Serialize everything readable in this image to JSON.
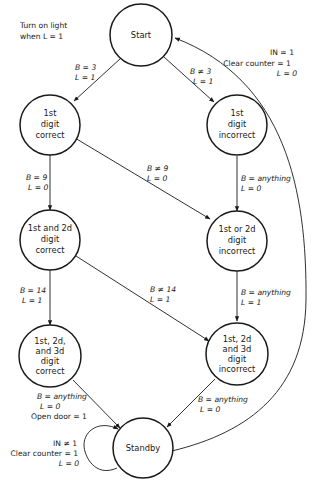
{
  "note": {
    "line1": "Turn on light",
    "line2": "when L = 1"
  },
  "states": [
    {
      "id": "start",
      "lines": [
        "Start"
      ]
    },
    {
      "id": "d1_correct",
      "lines": [
        "1st",
        "digit",
        "correct"
      ]
    },
    {
      "id": "d1_incorrect",
      "lines": [
        "1st",
        "digit",
        "incorrect"
      ]
    },
    {
      "id": "d12_correct",
      "lines": [
        "1st and 2d",
        "digit",
        "correct"
      ]
    },
    {
      "id": "d12_incorrect",
      "lines": [
        "1st or 2d",
        "digit",
        "incorrect"
      ]
    },
    {
      "id": "d123_correct",
      "lines": [
        "1st, 2d,",
        "and 3d",
        "digit",
        "correct"
      ]
    },
    {
      "id": "d123_incorrect",
      "lines": [
        "1st, 2d",
        "and 3d",
        "digit",
        "incorrect"
      ]
    },
    {
      "id": "standby",
      "lines": [
        "Standby"
      ]
    }
  ],
  "edges": [
    {
      "from": "start",
      "to": "d1_correct",
      "lines": [
        "B = 3",
        "L = 1"
      ]
    },
    {
      "from": "start",
      "to": "d1_incorrect",
      "lines": [
        "B ≠ 3",
        "L = 1"
      ]
    },
    {
      "from": "d1_correct",
      "to": "d12_correct",
      "lines": [
        "B = 9",
        "L = 0"
      ]
    },
    {
      "from": "d1_correct",
      "to": "d12_incorrect",
      "lines": [
        "B ≠ 9",
        "L = 0"
      ]
    },
    {
      "from": "d1_incorrect",
      "to": "d12_incorrect",
      "lines": [
        "B = anything",
        "L = 0"
      ]
    },
    {
      "from": "d12_correct",
      "to": "d123_correct",
      "lines": [
        "B = 14",
        "L = 1"
      ]
    },
    {
      "from": "d12_correct",
      "to": "d123_incorrect",
      "lines": [
        "B ≠ 14",
        "L = 1"
      ]
    },
    {
      "from": "d12_incorrect",
      "to": "d123_incorrect",
      "lines": [
        "B = anything",
        "L = 1"
      ]
    },
    {
      "from": "d123_correct",
      "to": "standby",
      "lines": [
        "B = anything",
        "L = 0",
        "Open door = 1"
      ]
    },
    {
      "from": "d123_incorrect",
      "to": "standby",
      "lines": [
        "B = anything",
        "L = 0"
      ]
    },
    {
      "from": "standby",
      "to": "start",
      "lines": [
        "IN = 1",
        "Clear counter = 1",
        "L = 0"
      ]
    },
    {
      "from": "standby",
      "to": "standby",
      "lines": [
        "IN ≠ 1",
        "Clear counter = 1",
        "L = 0"
      ]
    }
  ]
}
